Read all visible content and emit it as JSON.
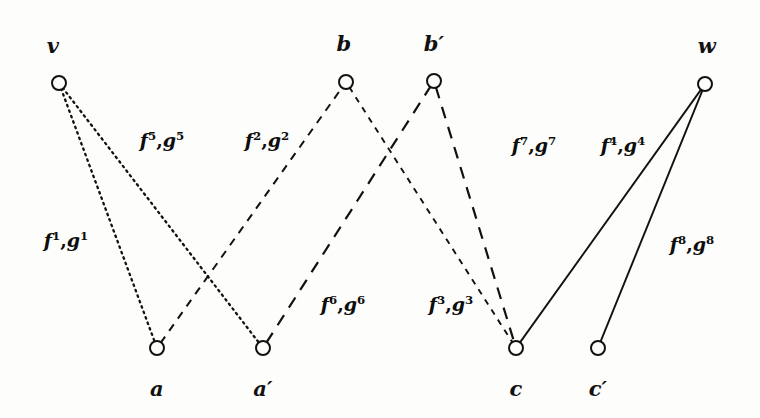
{
  "figure": {
    "kind": "bipartite-multilevel-graph",
    "background_color": "#fdfdfc",
    "ink_color": "#111111",
    "width": 760,
    "height": 418
  },
  "nodes": [
    {
      "id": "v",
      "label": "v",
      "x": 59,
      "y": 83,
      "label_x": 53,
      "label_y": 45,
      "radius": 7
    },
    {
      "id": "b",
      "label": "b",
      "x": 346,
      "y": 82,
      "label_x": 344,
      "label_y": 43,
      "radius": 7
    },
    {
      "id": "bp",
      "label": "b′",
      "x": 434,
      "y": 81,
      "label_x": 434,
      "label_y": 43,
      "radius": 7
    },
    {
      "id": "w",
      "label": "w",
      "x": 705,
      "y": 84,
      "label_x": 707,
      "label_y": 45,
      "radius": 7
    },
    {
      "id": "a",
      "label": "a",
      "x": 157,
      "y": 348,
      "label_x": 157,
      "label_y": 388,
      "radius": 7
    },
    {
      "id": "ap",
      "label": "a′",
      "x": 263,
      "y": 348,
      "label_x": 263,
      "label_y": 388,
      "radius": 7
    },
    {
      "id": "c",
      "label": "c",
      "x": 516,
      "y": 348,
      "label_x": 516,
      "label_y": 388,
      "radius": 7
    },
    {
      "id": "cp",
      "label": "c′",
      "x": 598,
      "y": 348,
      "label_x": 598,
      "label_y": 388,
      "radius": 7
    }
  ],
  "edges": [
    {
      "id": "e1",
      "from": "v",
      "to": "a",
      "style": "dotted",
      "f": "f",
      "g": "g",
      "index": "1",
      "label_text": "f1,g1",
      "label_x": 66,
      "label_y": 240
    },
    {
      "id": "e5",
      "from": "v",
      "to": "ap",
      "style": "dotted",
      "f": "f",
      "g": "g",
      "index": "5",
      "label_text": "f5,g5",
      "label_x": 162,
      "label_y": 140
    },
    {
      "id": "e2",
      "from": "a",
      "to": "b",
      "style": "dashed",
      "f": "f",
      "g": "g",
      "index": "2",
      "label_text": "f2,g2",
      "label_x": 267,
      "label_y": 140
    },
    {
      "id": "e6",
      "from": "ap",
      "to": "bp",
      "style": "long-dash",
      "f": "f",
      "g": "g",
      "index": "6",
      "label_text": "f6,g6",
      "label_x": 343,
      "label_y": 304
    },
    {
      "id": "e3",
      "from": "b",
      "to": "c",
      "style": "fine-dash",
      "f": "f",
      "g": "g",
      "index": "3",
      "label_text": "f3,g3",
      "label_x": 451,
      "label_y": 304
    },
    {
      "id": "e7",
      "from": "bp",
      "to": "c",
      "style": "long-dash",
      "f": "f",
      "g": "g",
      "index": "7",
      "label_text": "f7,g7",
      "label_x": 534,
      "label_y": 145
    },
    {
      "id": "e4",
      "from": "c",
      "to": "w",
      "style": "solid",
      "f": "f",
      "g": "g",
      "index": "4",
      "label_text": "f4,g4",
      "label_x": 623,
      "label_y": 145
    },
    {
      "id": "e8",
      "from": "cp",
      "to": "w",
      "style": "solid",
      "f": "f",
      "g": "g",
      "index": "8",
      "label_text": "f8,g8",
      "label_x": 692,
      "label_y": 244
    }
  ]
}
